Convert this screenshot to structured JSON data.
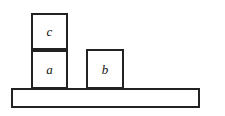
{
  "figure": {
    "background_color": "#ffffff",
    "stroke_color": "#222222",
    "fill_color": "#ffffff"
  },
  "blocks": [
    {
      "id": "c",
      "label": "c",
      "x": 31,
      "y": 13,
      "width": 37,
      "height": 37,
      "resting_on": "a"
    },
    {
      "id": "a",
      "label": "a",
      "x": 31,
      "y": 50,
      "width": 37,
      "height": 39,
      "resting_on": "table"
    },
    {
      "id": "b",
      "label": "b",
      "x": 86,
      "y": 49,
      "width": 38,
      "height": 40,
      "resting_on": "table"
    }
  ],
  "table": {
    "name": "table",
    "label": "",
    "x": 11,
    "y": 88,
    "width": 189,
    "height": 20
  }
}
